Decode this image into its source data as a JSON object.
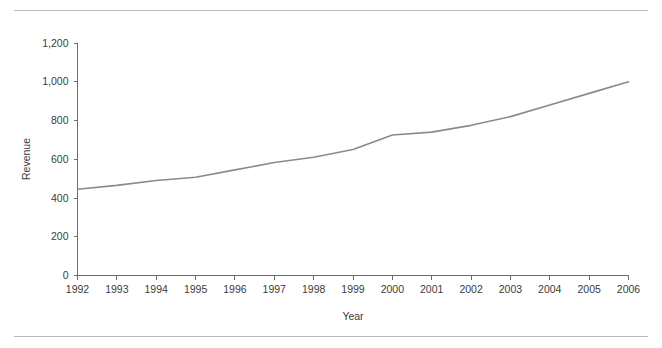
{
  "figure": {
    "clipped_caption_top": "",
    "background": "#ffffff",
    "rule_color": "#b9b9b9"
  },
  "chart_data": {
    "type": "line",
    "title": "",
    "xlabel": "Year",
    "ylabel": "Revenue",
    "x": [
      1992,
      1993,
      1994,
      1995,
      1996,
      1997,
      1998,
      1999,
      2000,
      2001,
      2002,
      2003,
      2004,
      2005,
      2006
    ],
    "values": [
      445,
      465,
      490,
      507,
      545,
      583,
      610,
      650,
      725,
      740,
      775,
      820,
      880,
      940,
      1000
    ],
    "series": [
      {
        "name": "Revenue",
        "values": [
          445,
          465,
          490,
          507,
          545,
          583,
          610,
          650,
          725,
          740,
          775,
          820,
          880,
          940,
          1000
        ]
      }
    ],
    "xlim": [
      1992,
      2006
    ],
    "ylim": [
      0,
      1200
    ],
    "yticks": [
      0,
      200,
      400,
      600,
      800,
      1000,
      1200
    ],
    "ytick_labels": [
      "0",
      "200",
      "400",
      "600",
      "800",
      "1,000",
      "1,200"
    ],
    "xtick_labels": [
      "1992",
      "1993",
      "1994",
      "1995",
      "1996",
      "1997",
      "1998",
      "1999",
      "2000",
      "2001",
      "2002",
      "2003",
      "2004",
      "2005",
      "2006"
    ],
    "grid": false,
    "legend": false,
    "line_color": "#8a8a8a",
    "axis_color": "#6e6e6e"
  }
}
